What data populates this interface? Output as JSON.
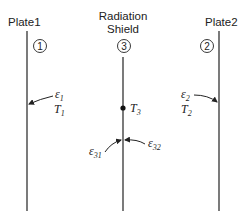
{
  "diagram": {
    "plate1": {
      "label": "Plate1",
      "number": "1",
      "emissivity_symbol": "ε",
      "emissivity_sub": "1",
      "temp_symbol": "T",
      "temp_sub": "1"
    },
    "shield": {
      "label_line1": "Radiation",
      "label_line2": "Shield",
      "number": "3",
      "temp_symbol": "T",
      "temp_sub": "3",
      "emissivity_left_symbol": "ε",
      "emissivity_left_sub": "31",
      "emissivity_right_symbol": "ε",
      "emissivity_right_sub": "32"
    },
    "plate2": {
      "label": "Plate2",
      "number": "2",
      "emissivity_symbol": "ε",
      "emissivity_sub": "2",
      "temp_symbol": "T",
      "temp_sub": "2"
    },
    "colors": {
      "line": "#333333",
      "text": "#222222",
      "background": "#ffffff"
    }
  }
}
